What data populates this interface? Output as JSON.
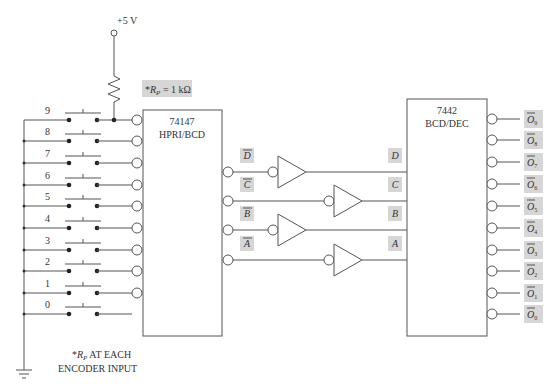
{
  "supply": {
    "label": "+5 V"
  },
  "pullup": {
    "label_prefix": "*",
    "label_var": "R",
    "label_sub": "P",
    "label_value": " = 1 kΩ"
  },
  "note": {
    "line1_prefix": "*",
    "line1_var": "R",
    "line1_sub": "P",
    "line1_rest": " AT EACH",
    "line2": "ENCODER INPUT"
  },
  "switches": [
    "9",
    "8",
    "7",
    "6",
    "5",
    "4",
    "3",
    "2",
    "1",
    "0"
  ],
  "encoder": {
    "part": "74147",
    "function": "HPRI/BCD"
  },
  "decoder": {
    "part": "7442",
    "function": "BCD/DEC"
  },
  "encoder_outputs": [
    "D",
    "C",
    "B",
    "A"
  ],
  "decoder_inputs": [
    "D",
    "C",
    "B",
    "A"
  ],
  "decoder_outputs": [
    {
      "name": "O",
      "sub": "9"
    },
    {
      "name": "O",
      "sub": "8"
    },
    {
      "name": "O",
      "sub": "7"
    },
    {
      "name": "O",
      "sub": "6"
    },
    {
      "name": "O",
      "sub": "5"
    },
    {
      "name": "O",
      "sub": "4"
    },
    {
      "name": "O",
      "sub": "3"
    },
    {
      "name": "O",
      "sub": "2"
    },
    {
      "name": "O",
      "sub": "1"
    },
    {
      "name": "O",
      "sub": "0"
    }
  ],
  "colors": {
    "line": "#555555",
    "label_bg": "#d6d6d6"
  }
}
